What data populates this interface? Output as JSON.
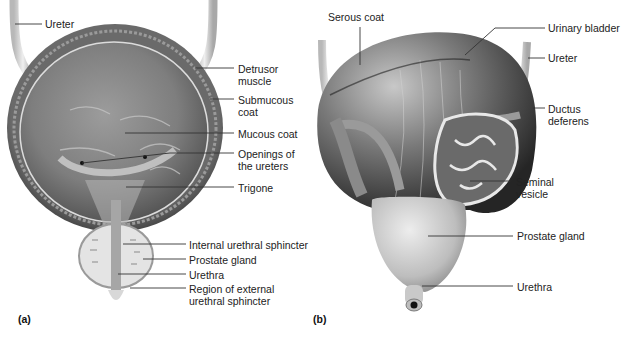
{
  "figure": {
    "panels": [
      {
        "id": "a",
        "tag": "(a)",
        "view": "frontal section of urinary bladder",
        "labels": [
          {
            "key": "ureter",
            "text": "Ureter"
          },
          {
            "key": "detrusor_muscle",
            "line1": "Detrusor",
            "line2": "muscle"
          },
          {
            "key": "submucous_coat",
            "line1": "Submucous",
            "line2": "coat"
          },
          {
            "key": "mucous_coat",
            "text": "Mucous coat"
          },
          {
            "key": "openings_of_ureters",
            "line1": "Openings of",
            "line2": "the ureters"
          },
          {
            "key": "trigone",
            "text": "Trigone"
          },
          {
            "key": "internal_urethral_sphincter",
            "text": "Internal urethral sphincter"
          },
          {
            "key": "prostate_gland",
            "text": "Prostate gland"
          },
          {
            "key": "urethra",
            "text": "Urethra"
          },
          {
            "key": "external_urethral_sphincter",
            "line1": "Region of external",
            "line2": "urethral sphincter"
          }
        ]
      },
      {
        "id": "b",
        "tag": "(b)",
        "view": "posterior view of urinary bladder",
        "labels": [
          {
            "key": "serous_coat",
            "text": "Serous coat"
          },
          {
            "key": "urinary_bladder",
            "text": "Urinary bladder"
          },
          {
            "key": "ureter",
            "text": "Ureter"
          },
          {
            "key": "ductus_deferens",
            "line1": "Ductus",
            "line2": "deferens"
          },
          {
            "key": "seminal_vesicle",
            "line1": "Seminal",
            "line2": "vesicle"
          },
          {
            "key": "prostate_gland",
            "text": "Prostate gland"
          },
          {
            "key": "urethra",
            "text": "Urethra"
          }
        ]
      }
    ],
    "colors": {
      "background": "#ffffff",
      "leader_line": "#333333",
      "tissue_dark": "#3a3a3a",
      "tissue_mid": "#8a8a8a",
      "tissue_light": "#d9d9d9"
    }
  }
}
